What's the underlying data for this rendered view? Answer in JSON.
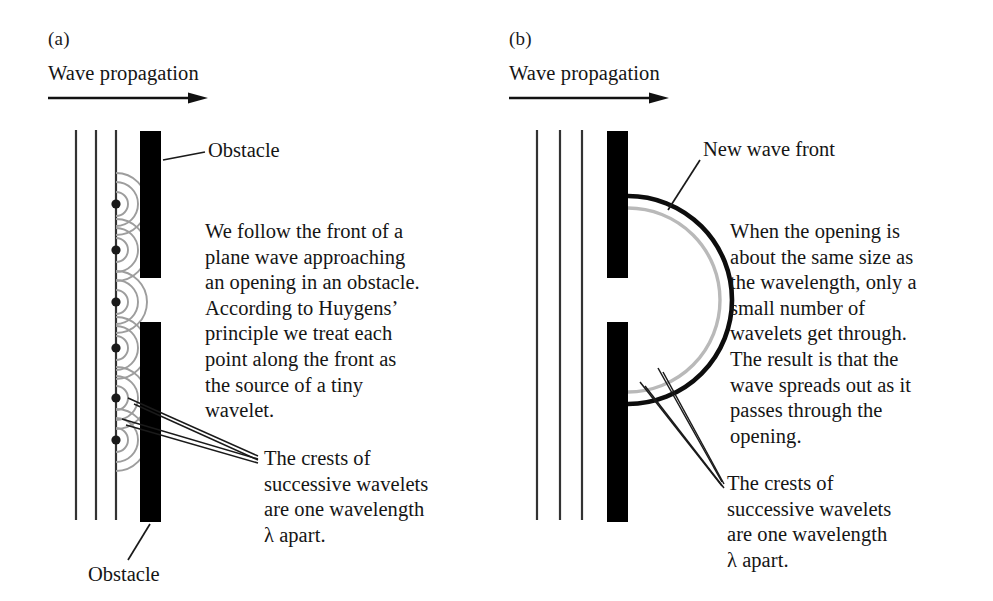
{
  "figure": {
    "title_implied": "Huygens' principle and diffraction through an opening",
    "colors": {
      "ink": "#1a1a1a",
      "obstacle": "#000000",
      "wavelet_arc": "#9a9a9a",
      "wavefront_outer": "#000000",
      "wavefront_inner": "#b5b5b5",
      "background": "#ffffff"
    }
  },
  "panel_a": {
    "label": "(a)",
    "propagation_label": "Wave propagation",
    "arrow_icon": "arrow-right-icon",
    "obstacle_top_label": "Obstacle",
    "obstacle_bottom_label": "Obstacle",
    "body_text": [
      "We follow the front of a",
      "plane wave approaching",
      "an opening in an obstacle.",
      "According to Huygens’",
      "principle we treat each",
      "point along the front as",
      "the source of a tiny",
      "wavelet."
    ],
    "crest_callout": [
      "The crests of",
      "successive wavelets",
      "are one wavelength",
      "λ apart."
    ]
  },
  "panel_b": {
    "label": "(b)",
    "propagation_label": "Wave propagation",
    "arrow_icon": "arrow-right-icon",
    "wavefront_label": "New wave front",
    "body_text": [
      "When the opening is",
      "about the same size as",
      "the wavelength, only a",
      "small number of",
      "wavelets get through.",
      "The result is that the",
      "wave spreads out as it",
      "passes through the",
      "opening."
    ],
    "crest_callout": [
      "The crests of",
      "successive wavelets",
      "are one wavelength",
      "λ apart."
    ]
  },
  "geometry": {
    "panel_a": {
      "plane_wave_lines_x": [
        76,
        96,
        116
      ],
      "plane_wave_top": 130,
      "plane_wave_bottom": 520,
      "obstacle_x": 140,
      "obstacle_width": 21,
      "obstacle_top_y": 131,
      "obstacle_top_height": 147,
      "obstacle_bottom_y": 322,
      "obstacle_bottom_height": 200,
      "wavelet_source_x": 116,
      "wavelet_source_y": [
        204,
        250,
        302,
        348,
        398,
        440
      ],
      "wavelet_radii": [
        12,
        22,
        31
      ],
      "source_dot_radius": 4.5
    },
    "panel_b": {
      "plane_wave_lines_x": [
        37,
        60,
        82
      ],
      "plane_wave_top": 130,
      "plane_wave_bottom": 520,
      "obstacle_x": 107,
      "obstacle_width": 21,
      "obstacle_top_y": 131,
      "obstacle_top_height": 147,
      "obstacle_bottom_y": 322,
      "obstacle_bottom_height": 200,
      "arc_center_x": 128,
      "arc_center_y": 300,
      "arc_outer_radius": 104,
      "arc_inner_radius": 92
    }
  }
}
